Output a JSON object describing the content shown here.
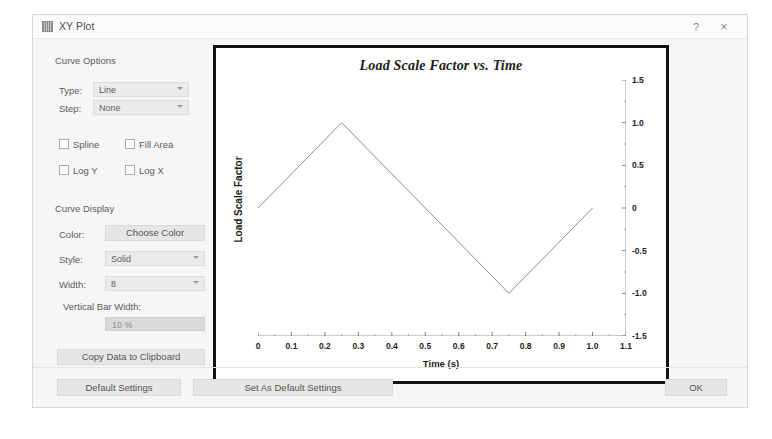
{
  "window": {
    "title": "XY Plot",
    "icon": "plot-window-icon",
    "help_label": "?",
    "close_label": "×"
  },
  "curve_options": {
    "section_title": "Curve Options",
    "type_label": "Type:",
    "type_value": "Line",
    "step_label": "Step:",
    "step_value": "None",
    "spline_label": "Spline",
    "fill_area_label": "Fill Area",
    "log_y_label": "Log Y",
    "log_x_label": "Log X"
  },
  "curve_display": {
    "section_title": "Curve Display",
    "color_label": "Color:",
    "choose_color_label": "Choose Color",
    "style_label": "Style:",
    "style_value": "Solid",
    "width_label": "Width:",
    "width_value": "8",
    "vertical_bar_width_label": "Vertical Bar Width:",
    "vertical_bar_width_value": "10 %"
  },
  "actions": {
    "copy_data_label": "Copy Data to Clipboard",
    "show_grid_label": "Show Grid",
    "default_settings_label": "Default Settings",
    "set_as_default_settings_label": "Set As Default Settings",
    "ok_label": "OK"
  },
  "chart_data": {
    "type": "line",
    "title": "Load Scale Factor vs. Time",
    "xlabel": "Time (s)",
    "ylabel": "Load Scale Factor",
    "xlim": [
      0,
      1.1
    ],
    "ylim": [
      -1.5,
      1.5
    ],
    "grid": false,
    "legend": "none",
    "y_axis_position": "right",
    "xticks": [
      "0",
      "0.1",
      "0.2",
      "0.3",
      "0.4",
      "0.5",
      "0.6",
      "0.7",
      "0.8",
      "0.9",
      "1.0",
      "1.1"
    ],
    "xtick_values": [
      0,
      0.1,
      0.2,
      0.3,
      0.4,
      0.5,
      0.6,
      0.7,
      0.8,
      0.9,
      1.0,
      1.1
    ],
    "yticks": [
      "1.5",
      "1.0",
      "0.5",
      "0",
      "-0.5",
      "-1.0",
      "-1.5"
    ],
    "ytick_values": [
      1.5,
      1.0,
      0.5,
      0,
      -0.5,
      -1.0,
      -1.5
    ],
    "series": [
      {
        "name": "Load Scale Factor",
        "color": "#8c8c8c",
        "x": [
          0,
          0.25,
          0.75,
          1.0
        ],
        "y": [
          0,
          1.0,
          -1.0,
          0
        ]
      }
    ]
  }
}
